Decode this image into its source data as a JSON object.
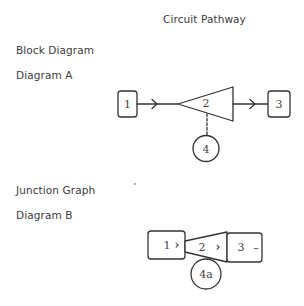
{
  "page": {
    "title": "Circuit Pathway"
  },
  "sections": [
    {
      "heading": "Block Diagram",
      "subheading": "Diagram A",
      "nodes": [
        {
          "id": "1",
          "label": "1",
          "shape": "rounded-square"
        },
        {
          "id": "2",
          "label": "2",
          "shape": "triangle"
        },
        {
          "id": "3",
          "label": "3",
          "shape": "rounded-square"
        },
        {
          "id": "4",
          "label": "4",
          "shape": "circle"
        }
      ],
      "edges": [
        {
          "from": "1",
          "to": "2",
          "style": "solid-arrow"
        },
        {
          "from": "2",
          "to": "3",
          "style": "solid-arrow"
        },
        {
          "from": "2",
          "to": "4",
          "style": "dashed"
        }
      ]
    },
    {
      "heading": "Junction Graph",
      "subheading": "Diagram B",
      "nodes": [
        {
          "id": "1",
          "label": "1",
          "marker": "›",
          "shape": "rounded-rect"
        },
        {
          "id": "2",
          "label": "2",
          "marker": "›",
          "shape": "trapezoid"
        },
        {
          "id": "3",
          "label": "3",
          "marker": "–",
          "shape": "rounded-rect"
        },
        {
          "id": "4a",
          "label": "4a",
          "shape": "circle"
        }
      ]
    }
  ],
  "colors": {
    "stroke": "#333333",
    "text": "#3a3a3a",
    "background": "#ffffff"
  }
}
